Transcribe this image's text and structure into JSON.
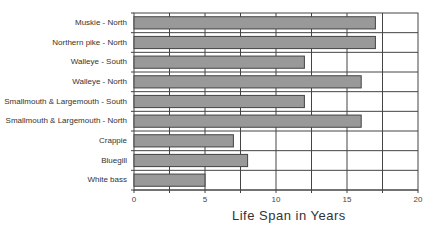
{
  "chart_data": {
    "type": "bar",
    "orientation": "horizontal",
    "title": "",
    "xlabel": "Life Span in Years",
    "ylabel": "",
    "categories": [
      "Muskie - North",
      "Northern pike - North",
      "Walleye - South",
      "Walleye - North",
      "Smallmouth & Largemouth - South",
      "Smallmouth & Largemouth - North",
      "Crappie",
      "Bluegill",
      "White bass"
    ],
    "values": [
      17,
      17,
      12,
      16,
      12,
      16,
      7,
      8,
      5
    ],
    "xlim": [
      0,
      20
    ],
    "x_ticks": [
      "0",
      "5",
      "10",
      "15",
      "20"
    ],
    "minor_gridlines_every": 2.5,
    "grid": true,
    "legend": "none",
    "bar_color": "#999999",
    "bar_border_color": "#444444",
    "grid_color": "#444444"
  }
}
